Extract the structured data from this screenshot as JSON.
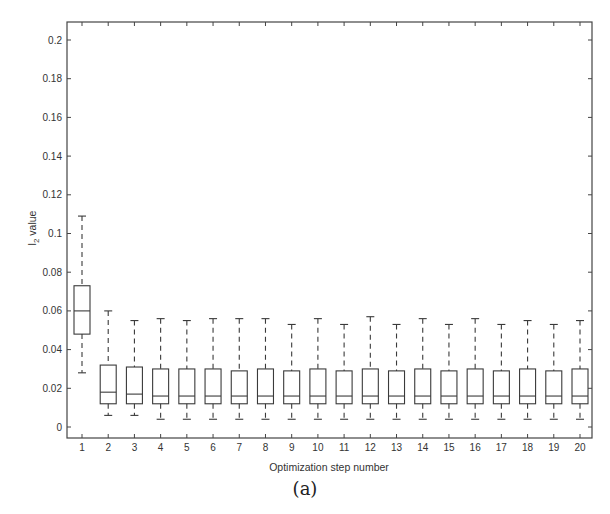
{
  "chart_data": {
    "type": "boxplot",
    "title": "",
    "xlabel": "Optimization step number",
    "ylabel": "l2 value",
    "ylabel_main": "l",
    "ylabel_sub": "2",
    "ylabel_rest": " value",
    "ylim": [
      -0.002,
      0.209
    ],
    "yticks": [
      0,
      0.02,
      0.04,
      0.06,
      0.08,
      0.1,
      0.12,
      0.14,
      0.16,
      0.18,
      0.2
    ],
    "ytick_labels": [
      "0",
      "0.02",
      "0.04",
      "0.06",
      "0.08",
      "0.1",
      "0.12",
      "0.14",
      "0.16",
      "0.18",
      "0.2"
    ],
    "categories": [
      "1",
      "2",
      "3",
      "4",
      "5",
      "6",
      "7",
      "8",
      "9",
      "10",
      "11",
      "12",
      "13",
      "14",
      "15",
      "16",
      "17",
      "18",
      "19",
      "20"
    ],
    "grid": false,
    "legend": null,
    "boxes": [
      {
        "step": 1,
        "whisker_low": 0.028,
        "q1": 0.048,
        "median": 0.06,
        "q3": 0.073,
        "whisker_high": 0.109
      },
      {
        "step": 2,
        "whisker_low": 0.006,
        "q1": 0.012,
        "median": 0.018,
        "q3": 0.032,
        "whisker_high": 0.06
      },
      {
        "step": 3,
        "whisker_low": 0.006,
        "q1": 0.012,
        "median": 0.017,
        "q3": 0.031,
        "whisker_high": 0.055
      },
      {
        "step": 4,
        "whisker_low": 0.004,
        "q1": 0.012,
        "median": 0.016,
        "q3": 0.03,
        "whisker_high": 0.056
      },
      {
        "step": 5,
        "whisker_low": 0.004,
        "q1": 0.012,
        "median": 0.016,
        "q3": 0.03,
        "whisker_high": 0.055
      },
      {
        "step": 6,
        "whisker_low": 0.004,
        "q1": 0.012,
        "median": 0.016,
        "q3": 0.03,
        "whisker_high": 0.056
      },
      {
        "step": 7,
        "whisker_low": 0.004,
        "q1": 0.012,
        "median": 0.016,
        "q3": 0.029,
        "whisker_high": 0.056
      },
      {
        "step": 8,
        "whisker_low": 0.004,
        "q1": 0.012,
        "median": 0.016,
        "q3": 0.03,
        "whisker_high": 0.056
      },
      {
        "step": 9,
        "whisker_low": 0.004,
        "q1": 0.012,
        "median": 0.016,
        "q3": 0.029,
        "whisker_high": 0.053
      },
      {
        "step": 10,
        "whisker_low": 0.004,
        "q1": 0.012,
        "median": 0.016,
        "q3": 0.03,
        "whisker_high": 0.056
      },
      {
        "step": 11,
        "whisker_low": 0.004,
        "q1": 0.012,
        "median": 0.016,
        "q3": 0.029,
        "whisker_high": 0.053
      },
      {
        "step": 12,
        "whisker_low": 0.004,
        "q1": 0.012,
        "median": 0.016,
        "q3": 0.03,
        "whisker_high": 0.057
      },
      {
        "step": 13,
        "whisker_low": 0.004,
        "q1": 0.012,
        "median": 0.016,
        "q3": 0.029,
        "whisker_high": 0.053
      },
      {
        "step": 14,
        "whisker_low": 0.004,
        "q1": 0.012,
        "median": 0.016,
        "q3": 0.03,
        "whisker_high": 0.056
      },
      {
        "step": 15,
        "whisker_low": 0.004,
        "q1": 0.012,
        "median": 0.016,
        "q3": 0.029,
        "whisker_high": 0.053
      },
      {
        "step": 16,
        "whisker_low": 0.004,
        "q1": 0.012,
        "median": 0.016,
        "q3": 0.03,
        "whisker_high": 0.056
      },
      {
        "step": 17,
        "whisker_low": 0.004,
        "q1": 0.012,
        "median": 0.016,
        "q3": 0.029,
        "whisker_high": 0.053
      },
      {
        "step": 18,
        "whisker_low": 0.004,
        "q1": 0.012,
        "median": 0.016,
        "q3": 0.03,
        "whisker_high": 0.055
      },
      {
        "step": 19,
        "whisker_low": 0.004,
        "q1": 0.012,
        "median": 0.016,
        "q3": 0.029,
        "whisker_high": 0.053
      },
      {
        "step": 20,
        "whisker_low": 0.004,
        "q1": 0.012,
        "median": 0.016,
        "q3": 0.03,
        "whisker_high": 0.055
      }
    ]
  },
  "caption": "(a)",
  "colors": {
    "axis": "#444444",
    "box": "#3a3a3a",
    "background": "#ffffff"
  }
}
